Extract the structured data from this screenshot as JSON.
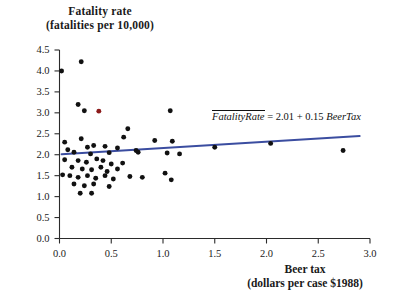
{
  "chart_data": {
    "type": "scatter",
    "title": "",
    "ylabel": "Fatality rate (fatalities per 10,000)",
    "ylabel_line1": "Fatality rate",
    "ylabel_line2": "(fatalities per 10,000)",
    "xlabel": "Beer tax (dollars per case $1988)",
    "xlabel_line1": "Beer tax",
    "xlabel_line2": "(dollars per case $1988)",
    "xlim": [
      0.0,
      3.0
    ],
    "ylim": [
      0.0,
      4.5
    ],
    "xticks": [
      "0.0",
      "0.5",
      "1.0",
      "1.5",
      "2.0",
      "2.5",
      "3.0"
    ],
    "yticks": [
      "0.0",
      "0.5",
      "1.0",
      "1.5",
      "2.0",
      "2.5",
      "3.0",
      "3.5",
      "4.0",
      "4.5"
    ],
    "xtick_values": [
      0.0,
      0.5,
      1.0,
      1.5,
      2.0,
      2.5,
      3.0
    ],
    "ytick_values": [
      0.0,
      0.5,
      1.0,
      1.5,
      2.0,
      2.5,
      3.0,
      3.5,
      4.0,
      4.5
    ],
    "grid": false,
    "legend": "none",
    "marker_color": "#111111",
    "highlight_marker_color": "#8c1b1b",
    "fitline_color": "#3b4da0",
    "annotation": "FatalityRate = 2.01 + 0.15 BeerTax",
    "annotation_parts": {
      "yhat": "FatalityRate",
      "equals": "=",
      "intercept": "2.01",
      "plus": "+",
      "slope": "0.15",
      "regressor": "BeerTax"
    },
    "fit": {
      "intercept": 2.01,
      "slope": 0.15,
      "x_start": 0.02,
      "x_end": 2.9
    },
    "points": [
      {
        "x": 0.02,
        "y": 4.0,
        "color": "dark"
      },
      {
        "x": 0.21,
        "y": 4.22,
        "color": "dark"
      },
      {
        "x": 0.18,
        "y": 3.2,
        "color": "dark"
      },
      {
        "x": 0.24,
        "y": 3.05,
        "color": "dark"
      },
      {
        "x": 0.38,
        "y": 3.04,
        "color": "red"
      },
      {
        "x": 1.07,
        "y": 3.05,
        "color": "dark"
      },
      {
        "x": 0.66,
        "y": 2.62,
        "color": "dark"
      },
      {
        "x": 0.21,
        "y": 2.38,
        "color": "dark"
      },
      {
        "x": 0.62,
        "y": 2.42,
        "color": "dark"
      },
      {
        "x": 0.05,
        "y": 2.3,
        "color": "dark"
      },
      {
        "x": 0.92,
        "y": 2.34,
        "color": "dark"
      },
      {
        "x": 1.09,
        "y": 2.32,
        "color": "dark"
      },
      {
        "x": 0.08,
        "y": 2.12,
        "color": "dark"
      },
      {
        "x": 0.27,
        "y": 2.18,
        "color": "dark"
      },
      {
        "x": 0.33,
        "y": 2.22,
        "color": "dark"
      },
      {
        "x": 0.44,
        "y": 2.2,
        "color": "dark"
      },
      {
        "x": 0.56,
        "y": 2.16,
        "color": "dark"
      },
      {
        "x": 0.14,
        "y": 2.06,
        "color": "dark"
      },
      {
        "x": 0.3,
        "y": 2.02,
        "color": "dark"
      },
      {
        "x": 0.48,
        "y": 2.05,
        "color": "dark"
      },
      {
        "x": 0.74,
        "y": 2.1,
        "color": "dark"
      },
      {
        "x": 0.76,
        "y": 2.06,
        "color": "dark"
      },
      {
        "x": 1.04,
        "y": 2.04,
        "color": "dark"
      },
      {
        "x": 1.16,
        "y": 2.02,
        "color": "dark"
      },
      {
        "x": 1.5,
        "y": 2.18,
        "color": "dark"
      },
      {
        "x": 2.04,
        "y": 2.27,
        "color": "dark"
      },
      {
        "x": 2.74,
        "y": 2.1,
        "color": "dark"
      },
      {
        "x": 0.05,
        "y": 1.88,
        "color": "dark"
      },
      {
        "x": 0.18,
        "y": 1.86,
        "color": "dark"
      },
      {
        "x": 0.26,
        "y": 1.82,
        "color": "dark"
      },
      {
        "x": 0.36,
        "y": 1.9,
        "color": "dark"
      },
      {
        "x": 0.42,
        "y": 1.86,
        "color": "dark"
      },
      {
        "x": 0.5,
        "y": 1.78,
        "color": "dark"
      },
      {
        "x": 0.61,
        "y": 1.8,
        "color": "dark"
      },
      {
        "x": 0.12,
        "y": 1.7,
        "color": "dark"
      },
      {
        "x": 0.22,
        "y": 1.66,
        "color": "dark"
      },
      {
        "x": 0.31,
        "y": 1.64,
        "color": "dark"
      },
      {
        "x": 0.4,
        "y": 1.7,
        "color": "dark"
      },
      {
        "x": 0.46,
        "y": 1.6,
        "color": "dark"
      },
      {
        "x": 0.56,
        "y": 1.66,
        "color": "dark"
      },
      {
        "x": 0.03,
        "y": 1.52,
        "color": "dark"
      },
      {
        "x": 0.1,
        "y": 1.5,
        "color": "dark"
      },
      {
        "x": 0.18,
        "y": 1.46,
        "color": "dark"
      },
      {
        "x": 0.27,
        "y": 1.5,
        "color": "dark"
      },
      {
        "x": 0.35,
        "y": 1.44,
        "color": "dark"
      },
      {
        "x": 0.44,
        "y": 1.5,
        "color": "dark"
      },
      {
        "x": 0.52,
        "y": 1.42,
        "color": "dark"
      },
      {
        "x": 0.68,
        "y": 1.48,
        "color": "dark"
      },
      {
        "x": 0.8,
        "y": 1.46,
        "color": "dark"
      },
      {
        "x": 1.02,
        "y": 1.56,
        "color": "dark"
      },
      {
        "x": 1.08,
        "y": 1.4,
        "color": "dark"
      },
      {
        "x": 0.14,
        "y": 1.3,
        "color": "dark"
      },
      {
        "x": 0.24,
        "y": 1.26,
        "color": "dark"
      },
      {
        "x": 0.33,
        "y": 1.3,
        "color": "dark"
      },
      {
        "x": 0.48,
        "y": 1.24,
        "color": "dark"
      },
      {
        "x": 0.2,
        "y": 1.08,
        "color": "dark"
      },
      {
        "x": 0.31,
        "y": 1.08,
        "color": "dark"
      }
    ]
  }
}
